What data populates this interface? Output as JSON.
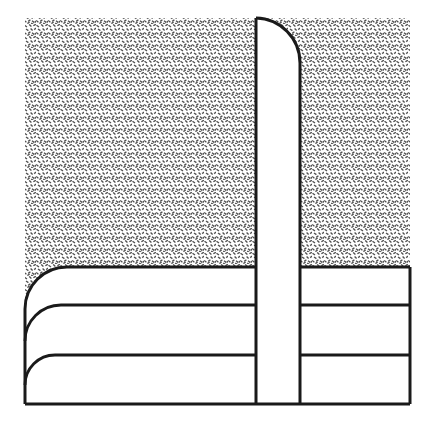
{
  "figure": {
    "title": "Cross-sectional technical line drawing",
    "kind": "patent-style-line-drawing",
    "canvas": {
      "width": 434,
      "height": 426
    },
    "colors": {
      "background": "#ffffff",
      "stroke": "#1a1a1a",
      "hatch_ink": "#555555",
      "fill_white": "#ffffff"
    },
    "stroke_widths": {
      "outline": 3.0,
      "inner_curve": 2.6,
      "band_divider": 3.0
    },
    "regions": {
      "hatched_field": {
        "name": "stippled-upper-field",
        "description": "Dense stipple / cross-hatch texture filling the upper block",
        "x": 25,
        "y": 18,
        "width": 385,
        "height": 249,
        "pattern": "stipple-dash",
        "pattern_tile": 6,
        "ink": "#555555"
      },
      "vertical_channel": {
        "name": "vertical-white-channel",
        "description": "White vertical band with rounded top-right corner running full height",
        "left_x": 256,
        "right_x": 300,
        "top_y": 18,
        "bottom_y": 404,
        "corner_radius": 45
      },
      "lower_left_curves": {
        "name": "nested-rounded-curves",
        "description": "Three nested rounded-corner contour lines in the lower-left quadrant",
        "left_x": 25,
        "count": 3,
        "curves": [
          {
            "label": "curve-outer",
            "y": 267,
            "radius": 42
          },
          {
            "label": "curve-middle",
            "y": 305,
            "radius": 36
          },
          {
            "label": "curve-inner",
            "y": 355,
            "radius": 30
          }
        ]
      },
      "lower_right_bands": {
        "name": "horizontal-band-stack",
        "description": "Three stacked rectangular bands bounded by straight horizontal rules",
        "left_x": 300,
        "right_x": 410,
        "count": 3,
        "rules_y": [
          267,
          305,
          355,
          404
        ]
      },
      "outer_frame": {
        "name": "outer-boundary",
        "left_x": 25,
        "right_x": 410,
        "top_y": 18,
        "bottom_y": 404
      }
    }
  }
}
